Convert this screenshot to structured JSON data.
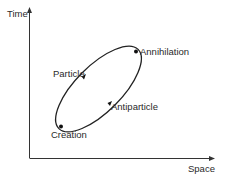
{
  "diagram": {
    "type": "spacetime-diagram",
    "axes": {
      "y_label": "Time",
      "x_label": "Space"
    },
    "events": {
      "creation": "Creation",
      "annihilation": "Annihilation"
    },
    "paths": {
      "particle": "Particle",
      "antiparticle": "Antiparticle"
    },
    "colors": {
      "line": "#222222",
      "text": "#2a2a2a"
    }
  }
}
